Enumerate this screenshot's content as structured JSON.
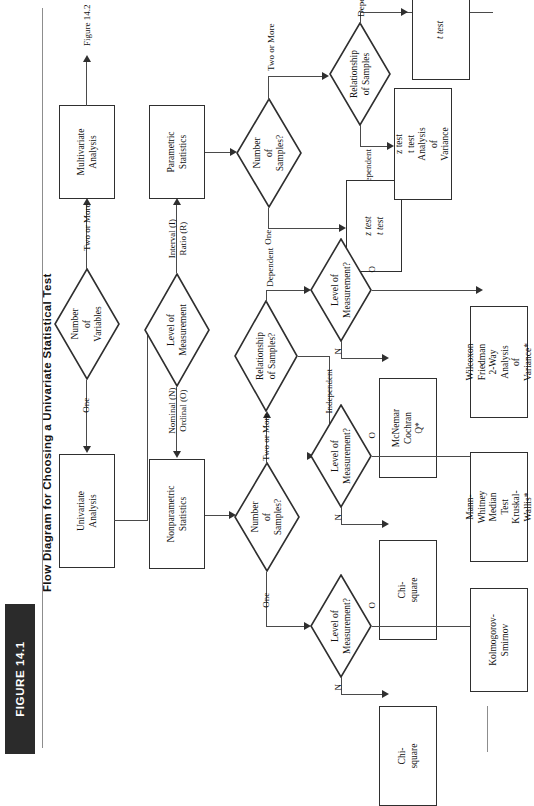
{
  "figure": {
    "badge": "FIGURE 14.1",
    "title": "Flow Diagram for Choosing a Univariate Statistical Test"
  },
  "nodes": {
    "number_of_variables": "Number\nof Variables",
    "univariate_analysis": "Univariate\nAnalysis",
    "multivariate_analysis": "Multivariate\nAnalysis",
    "figure_ref": "Figure 14.2",
    "level_of_measurement": "Level of\nMeasurement",
    "nonparametric_statistics": "Nonparametric\nStatistics",
    "parametric_statistics": "Parametric\nStatistics",
    "number_of_samples_param": "Number of\nSamples?",
    "number_of_samples_nonparam": "Number of\nSamples?",
    "relationship_of_samples_param": "Relationship\nof Samples",
    "relationship_of_samples_nonparam": "Relationship\nof Samples?",
    "lom_param_one": "Level of\nMeasurement?",
    "lom_np_one": "Level of\nMeasurement?",
    "lom_np_indep": "Level of\nMeasurement?",
    "lom_np_dep": "Level of\nMeasurement?"
  },
  "outcomes": {
    "param_one_sample": "z test\nt test",
    "param_indep": "z test\nt test\nAnalysis of\nVariance",
    "param_dep": "t test",
    "np_one_N": "Chi-square",
    "np_one_O": "Kolmogorov-\nSmirnov",
    "np_indep_N": "Chi-square",
    "np_indep_O": "Mann-Whitney\nMedian Test\nKruskal-Wallis*",
    "np_dep_N": "McNemar\nCochran Q*",
    "np_dep_O": "Wilcoxon\nFriedman 2-Way\nAnalysis of\nVariance*"
  },
  "edge_labels": {
    "one_variable": "One",
    "two_or_more_variables": "Two or More",
    "nominal_ordinal": "Nominal (N)\nOrdinal (O)",
    "interval_ratio": "Interval (I)\nRatio (R)",
    "param_one": "One",
    "param_two_or_more": "Two or More",
    "np_one": "One",
    "np_two_or_more": "Two or More",
    "dependent_param": "Dependent",
    "independent_param": "Independent",
    "dependent_np": "Dependent",
    "independent_np": "Independent",
    "n_param_one": "",
    "np_one_n": "N",
    "np_one_o": "O",
    "np_indep_n": "N",
    "np_indep_o": "O",
    "np_dep_n": "N",
    "np_dep_o": "O"
  },
  "colors": {
    "badge_bg": "#2b2b2b",
    "badge_fg": "#ffffff",
    "stroke": "#2f2f2f",
    "line": "#4a4a4a",
    "page_bg": "#ffffff"
  }
}
